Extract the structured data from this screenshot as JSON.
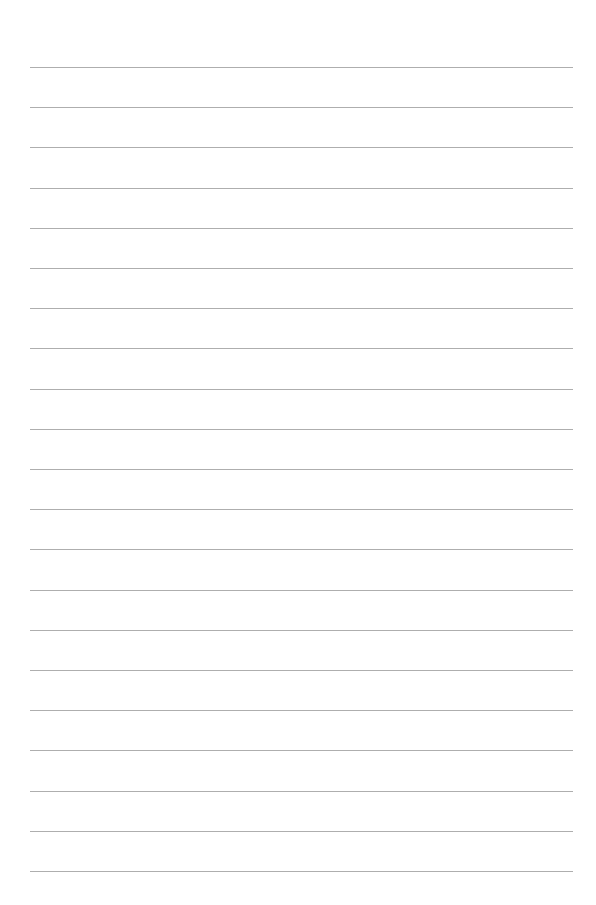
{
  "page": {
    "type": "lined-paper",
    "background_color": "#ffffff",
    "line_color": "#9a9a9a",
    "line_count": 21,
    "first_line_y": 67,
    "line_spacing": 40.2,
    "line_left": 30,
    "line_right": 573
  }
}
